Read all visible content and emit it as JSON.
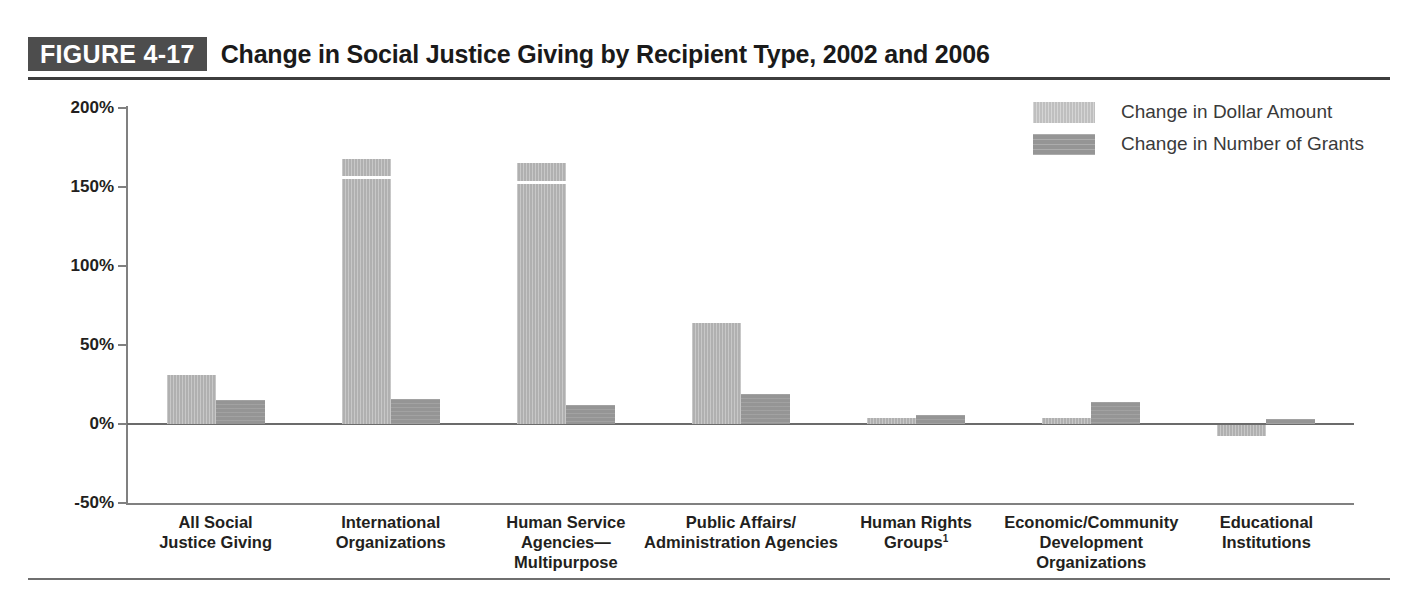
{
  "figure": {
    "tag": "FIGURE 4-17",
    "title": "Change in Social Justice Giving by Recipient Type, 2002 and 2006"
  },
  "legend": {
    "position": "top-right",
    "items": [
      {
        "label": "Change in Dollar Amount",
        "color": "#bfbfbf",
        "key": "dollar"
      },
      {
        "label": "Change in Number of Grants",
        "color": "#959595",
        "key": "grants"
      }
    ]
  },
  "axis": {
    "y_ticks": [
      "200%",
      "150%",
      "100%",
      "50%",
      "0%",
      "-50%"
    ],
    "y_tick_values": [
      200,
      150,
      100,
      50,
      0,
      -50
    ],
    "ylim": [
      -50,
      200
    ]
  },
  "chart_data": {
    "type": "bar",
    "title": "Change in Social Justice Giving by Recipient Type, 2002 and 2006",
    "xlabel": "",
    "ylabel": "",
    "ylim": [
      -50,
      200
    ],
    "grid": false,
    "legend_position": "top-right",
    "categories": [
      "All Social\nJustice Giving",
      "International\nOrganizations",
      "Human Service\nAgencies—\nMultipurpose",
      "Public Affairs/\nAdministration Agencies",
      "Human Rights\nGroups¹",
      "Economic/Community\nDevelopment\nOrganizations",
      "Educational\nInstitutions"
    ],
    "category_lines": [
      [
        "All Social",
        "Justice Giving"
      ],
      [
        "International",
        "Organizations"
      ],
      [
        "Human Service",
        "Agencies—",
        "Multipurpose"
      ],
      [
        "Public Affairs/",
        "Administration Agencies"
      ],
      [
        "Human Rights",
        "Groups¹"
      ],
      [
        "Economic/Community",
        "Development",
        "Organizations"
      ],
      [
        "Educational",
        "Institutions"
      ]
    ],
    "series": [
      {
        "name": "Change in Dollar Amount",
        "color": "#bfbfbf",
        "values": [
          31,
          168,
          165,
          64,
          4,
          4,
          -7
        ]
      },
      {
        "name": "Change in Number of Grants",
        "color": "#959595",
        "values": [
          15,
          16,
          12,
          19,
          6,
          14,
          3
        ]
      }
    ]
  },
  "footnote_marker": "1"
}
